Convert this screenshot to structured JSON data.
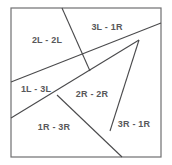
{
  "diagram": {
    "type": "line-partition-figure",
    "background_color": "#ffffff",
    "border_color": "#6f6f71",
    "line_color": "#4a4a4c",
    "label_color": "#58585a",
    "canvas": {
      "width": 172,
      "height": 165
    },
    "frame": {
      "x": 11,
      "y": 8,
      "width": 150,
      "height": 149
    },
    "segments": [
      {
        "name": "segment-top-to-center",
        "x1": 62,
        "y1": 8,
        "x2": 90,
        "y2": 71
      },
      {
        "name": "segment-left-to-right-vertex",
        "x1": 11,
        "y1": 82,
        "x2": 161,
        "y2": 23
      },
      {
        "name": "segment-left-lower-to-right-vertex",
        "x1": 11,
        "y1": 118,
        "x2": 139,
        "y2": 40
      },
      {
        "name": "segment-center-to-bottom",
        "x1": 57,
        "y1": 95,
        "x2": 122,
        "y2": 157
      },
      {
        "name": "segment-right-vertex-to-lower",
        "x1": 139,
        "y1": 40,
        "x2": 110,
        "y2": 131
      }
    ],
    "regions": [
      {
        "name": "region-2L-2L",
        "label": "2L - 2L",
        "x": 47,
        "y": 40
      },
      {
        "name": "region-3L-1R",
        "label": "3L - 1R",
        "x": 107,
        "y": 27
      },
      {
        "name": "region-1L-3L",
        "label": "1L - 3L",
        "x": 36,
        "y": 89
      },
      {
        "name": "region-2R-2R",
        "label": "2R - 2R",
        "x": 92,
        "y": 94
      },
      {
        "name": "region-1R-3R",
        "label": "1R - 3R",
        "x": 54,
        "y": 127
      },
      {
        "name": "region-3R-1R",
        "label": "3R - 1R",
        "x": 134,
        "y": 124
      }
    ]
  }
}
